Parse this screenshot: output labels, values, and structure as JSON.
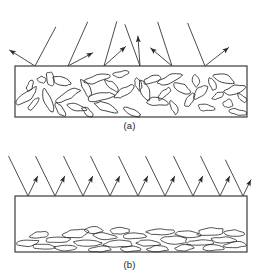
{
  "figure": {
    "type": "diagram",
    "background_color": "#ffffff",
    "line_color": "#2b2b2b",
    "box_fill": "#ffffff",
    "box_border_color": "#4a4a4a"
  },
  "panels": [
    {
      "id": "a",
      "caption": "(a)",
      "reflection_type": "diffuse",
      "box": {
        "x": 15,
        "y": 66,
        "width": 232,
        "height": 51
      },
      "particle_orientation": "random",
      "particle_count": 38,
      "incident_rays": [
        {
          "x_surface": 35,
          "angle_in_deg": 28,
          "angle_out_deg": -58,
          "len_in": 44,
          "len_out": 30
        },
        {
          "x_surface": 68,
          "angle_in_deg": 24,
          "angle_out_deg": 62,
          "len_in": 48,
          "len_out": 28
        },
        {
          "x_surface": 104,
          "angle_in_deg": 16,
          "angle_out_deg": 48,
          "len_in": 46,
          "len_out": 29
        },
        {
          "x_surface": 140,
          "angle_in_deg": -20,
          "angle_out_deg": -4,
          "len_in": 44,
          "len_out": 30
        },
        {
          "x_surface": 172,
          "angle_in_deg": -18,
          "angle_out_deg": -50,
          "len_in": 46,
          "len_out": 28
        },
        {
          "x_surface": 205,
          "angle_in_deg": -22,
          "angle_out_deg": 52,
          "len_in": 46,
          "len_out": 30
        }
      ],
      "particles": [
        {
          "cx": 27,
          "cy": 96,
          "rx": 14,
          "ry": 4,
          "rot": -38
        },
        {
          "cx": 34,
          "cy": 104,
          "rx": 9,
          "ry": 3,
          "rot": -52
        },
        {
          "cx": 42,
          "cy": 80,
          "rx": 5,
          "ry": 3,
          "rot": 20
        },
        {
          "cx": 50,
          "cy": 79,
          "rx": 8,
          "ry": 4,
          "rot": 78
        },
        {
          "cx": 48,
          "cy": 101,
          "rx": 11,
          "ry": 4,
          "rot": 72
        },
        {
          "cx": 60,
          "cy": 110,
          "rx": 8,
          "ry": 3,
          "rot": 58
        },
        {
          "cx": 62,
          "cy": 81,
          "rx": 10,
          "ry": 4,
          "rot": 16
        },
        {
          "cx": 68,
          "cy": 95,
          "rx": 13,
          "ry": 4,
          "rot": -28
        },
        {
          "cx": 76,
          "cy": 107,
          "rx": 10,
          "ry": 3,
          "rot": 12
        },
        {
          "cx": 86,
          "cy": 88,
          "rx": 9,
          "ry": 4,
          "rot": 62
        },
        {
          "cx": 96,
          "cy": 79,
          "rx": 13,
          "ry": 4,
          "rot": -12
        },
        {
          "cx": 100,
          "cy": 97,
          "rx": 15,
          "ry": 4,
          "rot": -14
        },
        {
          "cx": 106,
          "cy": 107,
          "rx": 12,
          "ry": 4,
          "rot": 22
        },
        {
          "cx": 112,
          "cy": 86,
          "rx": 9,
          "ry": 3,
          "rot": 40
        },
        {
          "cx": 124,
          "cy": 92,
          "rx": 11,
          "ry": 4,
          "rot": -36
        },
        {
          "cx": 132,
          "cy": 112,
          "rx": 9,
          "ry": 3,
          "rot": 26
        },
        {
          "cx": 138,
          "cy": 84,
          "rx": 7,
          "ry": 3,
          "rot": 74
        },
        {
          "cx": 145,
          "cy": 90,
          "rx": 10,
          "ry": 4,
          "rot": 66
        },
        {
          "cx": 152,
          "cy": 80,
          "rx": 9,
          "ry": 4,
          "rot": -18
        },
        {
          "cx": 156,
          "cy": 102,
          "rx": 11,
          "ry": 4,
          "rot": 8
        },
        {
          "cx": 164,
          "cy": 94,
          "rx": 8,
          "ry": 3,
          "rot": -44
        },
        {
          "cx": 170,
          "cy": 79,
          "rx": 12,
          "ry": 4,
          "rot": -22
        },
        {
          "cx": 174,
          "cy": 108,
          "rx": 7,
          "ry": 3,
          "rot": 66
        },
        {
          "cx": 182,
          "cy": 88,
          "rx": 9,
          "ry": 4,
          "rot": 30
        },
        {
          "cx": 190,
          "cy": 100,
          "rx": 8,
          "ry": 3,
          "rot": -60
        },
        {
          "cx": 196,
          "cy": 81,
          "rx": 6,
          "ry": 3,
          "rot": 84
        },
        {
          "cx": 200,
          "cy": 92,
          "rx": 10,
          "ry": 4,
          "rot": -48
        },
        {
          "cx": 206,
          "cy": 108,
          "rx": 9,
          "ry": 3,
          "rot": 6
        },
        {
          "cx": 212,
          "cy": 84,
          "rx": 7,
          "ry": 3,
          "rot": 70
        },
        {
          "cx": 218,
          "cy": 96,
          "rx": 6,
          "ry": 3,
          "rot": -30
        },
        {
          "cx": 224,
          "cy": 79,
          "rx": 10,
          "ry": 4,
          "rot": 18
        },
        {
          "cx": 228,
          "cy": 104,
          "rx": 5,
          "ry": 4,
          "rot": 0
        },
        {
          "cx": 234,
          "cy": 90,
          "rx": 11,
          "ry": 4,
          "rot": -16
        },
        {
          "cx": 238,
          "cy": 112,
          "rx": 9,
          "ry": 3,
          "rot": 10
        },
        {
          "cx": 120,
          "cy": 74,
          "rx": 8,
          "ry": 3,
          "rot": -8
        },
        {
          "cx": 88,
          "cy": 112,
          "rx": 7,
          "ry": 3,
          "rot": 34
        },
        {
          "cx": 30,
          "cy": 86,
          "rx": 6,
          "ry": 3,
          "rot": -70
        },
        {
          "cx": 242,
          "cy": 98,
          "rx": 6,
          "ry": 3,
          "rot": 44
        }
      ]
    },
    {
      "id": "b",
      "caption": "(b)",
      "reflection_type": "specular",
      "box": {
        "x": 15,
        "y": 196,
        "width": 232,
        "height": 56
      },
      "particle_orientation": "aligned-horizontal",
      "particle_count": 26,
      "incident_rays": [
        {
          "x_surface": 28,
          "angle_in_deg": -26,
          "angle_out_deg": 26,
          "len_in": 44,
          "len_out": 22
        },
        {
          "x_surface": 55,
          "angle_in_deg": -26,
          "angle_out_deg": 26,
          "len_in": 44,
          "len_out": 22
        },
        {
          "x_surface": 83,
          "angle_in_deg": -26,
          "angle_out_deg": 26,
          "len_in": 44,
          "len_out": 22
        },
        {
          "x_surface": 110,
          "angle_in_deg": -26,
          "angle_out_deg": 26,
          "len_in": 44,
          "len_out": 22
        },
        {
          "x_surface": 138,
          "angle_in_deg": -26,
          "angle_out_deg": 26,
          "len_in": 44,
          "len_out": 22
        },
        {
          "x_surface": 165,
          "angle_in_deg": -26,
          "angle_out_deg": 26,
          "len_in": 44,
          "len_out": 22
        },
        {
          "x_surface": 193,
          "angle_in_deg": -26,
          "angle_out_deg": 26,
          "len_in": 44,
          "len_out": 22
        },
        {
          "x_surface": 220,
          "angle_in_deg": -26,
          "angle_out_deg": 26,
          "len_in": 44,
          "len_out": 22
        },
        {
          "x_surface": 243,
          "angle_in_deg": -26,
          "angle_out_deg": 26,
          "len_in": 40,
          "len_out": 18
        }
      ],
      "particles": [
        {
          "cx": 28,
          "cy": 243,
          "rx": 12,
          "ry": 3,
          "rot": -4
        },
        {
          "cx": 44,
          "cy": 247,
          "rx": 13,
          "ry": 3,
          "rot": 2
        },
        {
          "cx": 40,
          "cy": 235,
          "rx": 11,
          "ry": 3,
          "rot": -6
        },
        {
          "cx": 58,
          "cy": 240,
          "rx": 14,
          "ry": 3,
          "rot": -2
        },
        {
          "cx": 66,
          "cy": 248,
          "rx": 10,
          "ry": 3,
          "rot": 3
        },
        {
          "cx": 76,
          "cy": 234,
          "rx": 13,
          "ry": 4,
          "rot": -5
        },
        {
          "cx": 88,
          "cy": 243,
          "rx": 15,
          "ry": 3,
          "rot": 1
        },
        {
          "cx": 100,
          "cy": 249,
          "rx": 11,
          "ry": 3,
          "rot": -3
        },
        {
          "cx": 104,
          "cy": 236,
          "rx": 12,
          "ry": 3,
          "rot": 4
        },
        {
          "cx": 118,
          "cy": 244,
          "rx": 14,
          "ry": 4,
          "rot": -2
        },
        {
          "cx": 130,
          "cy": 249,
          "rx": 10,
          "ry": 3,
          "rot": 2
        },
        {
          "cx": 134,
          "cy": 236,
          "rx": 13,
          "ry": 3,
          "rot": -4
        },
        {
          "cx": 148,
          "cy": 243,
          "rx": 12,
          "ry": 3,
          "rot": 3
        },
        {
          "cx": 158,
          "cy": 249,
          "rx": 11,
          "ry": 3,
          "rot": -2
        },
        {
          "cx": 160,
          "cy": 232,
          "rx": 14,
          "ry": 3,
          "rot": -3
        },
        {
          "cx": 174,
          "cy": 240,
          "rx": 13,
          "ry": 4,
          "rot": 2
        },
        {
          "cx": 184,
          "cy": 248,
          "rx": 10,
          "ry": 3,
          "rot": -4
        },
        {
          "cx": 188,
          "cy": 234,
          "rx": 12,
          "ry": 3,
          "rot": 3
        },
        {
          "cx": 200,
          "cy": 243,
          "rx": 14,
          "ry": 3,
          "rot": -2
        },
        {
          "cx": 212,
          "cy": 248,
          "rx": 11,
          "ry": 3,
          "rot": 2
        },
        {
          "cx": 210,
          "cy": 232,
          "rx": 13,
          "ry": 4,
          "rot": -5
        },
        {
          "cx": 224,
          "cy": 240,
          "rx": 12,
          "ry": 3,
          "rot": 1
        },
        {
          "cx": 236,
          "cy": 245,
          "rx": 11,
          "ry": 3,
          "rot": -3
        },
        {
          "cx": 234,
          "cy": 233,
          "rx": 10,
          "ry": 3,
          "rot": 4
        },
        {
          "cx": 120,
          "cy": 231,
          "rx": 10,
          "ry": 3,
          "rot": -3
        },
        {
          "cx": 94,
          "cy": 230,
          "rx": 9,
          "ry": 3,
          "rot": 2
        }
      ]
    }
  ]
}
